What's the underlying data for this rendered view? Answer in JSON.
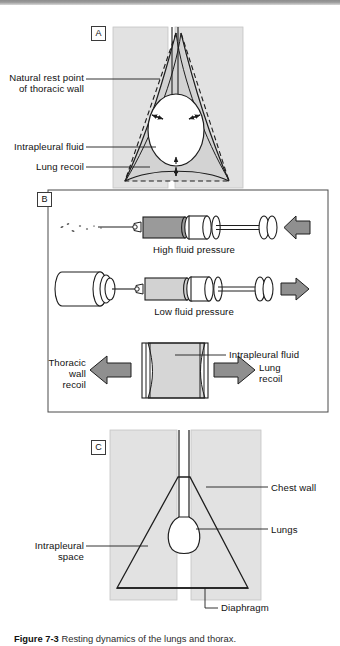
{
  "figure": {
    "caption_label": "Figure 7-3",
    "caption_text": "Resting dynamics of the lungs and thorax.",
    "panels": [
      {
        "tag": "A",
        "name": "panel-a"
      },
      {
        "tag": "B",
        "name": "panel-b"
      },
      {
        "tag": "C",
        "name": "panel-c"
      }
    ]
  },
  "panel_a": {
    "tag": "A",
    "labels": {
      "natural_rest_point_line1": "Natural rest point",
      "natural_rest_point_line2": "of thoracic wall",
      "intrapleural_fluid": "Intrapleural fluid",
      "lung_recoil": "Lung recoil"
    }
  },
  "panel_b": {
    "tag": "B",
    "labels": {
      "high_fluid_pressure": "High fluid pressure",
      "low_fluid_pressure": "Low fluid pressure",
      "intrapleural_fluid": "Intrapleural fluid",
      "thoracic_wall_recoil_line1": "Thoracic",
      "thoracic_wall_recoil_line2": "wall",
      "thoracic_wall_recoil_line3": "recoil",
      "lung_recoil_line1": "Lung",
      "lung_recoil_line2": "recoil"
    }
  },
  "panel_c": {
    "tag": "C",
    "labels": {
      "chest_wall": "Chest wall",
      "lungs": "Lungs",
      "intrapleural_space_line1": "Intrapleural",
      "intrapleural_space_line2": "space",
      "diaphragm": "Diaphragm"
    }
  },
  "colors": {
    "panel_fill": "#e2e2e2",
    "mid_gray": "#bdbdbd",
    "dark_gray": "#9a9a9a",
    "arrow_gray": "#8f8f8f",
    "stroke": "#1e1e1e",
    "white": "#ffffff",
    "topbar": "#8d8d8d"
  }
}
